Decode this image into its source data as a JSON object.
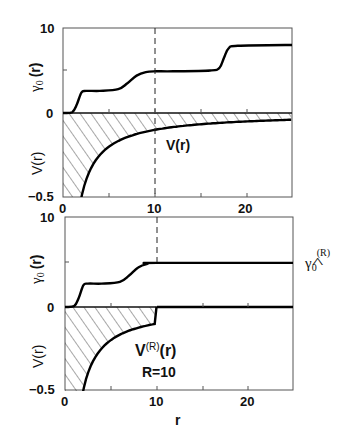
{
  "chart_data": [
    {
      "type": "line",
      "panel": "top",
      "xlabel": "r",
      "xlim": [
        0,
        25
      ],
      "x_ticks": [
        0,
        10,
        20
      ],
      "upper": {
        "ylabel": "γ0 (r)",
        "ylim": [
          0,
          10
        ],
        "y_ticks": [
          0,
          10
        ],
        "series": [
          {
            "name": "γ0(r)",
            "x": [
              0,
              1,
              1.5,
              2,
              2.5,
              4,
              6,
              7,
              8,
              9,
              10,
              12,
              16,
              17,
              17.5,
              18,
              19,
              25
            ],
            "y": [
              0,
              0.1,
              1.0,
              2.4,
              2.6,
              2.6,
              2.8,
              3.5,
              4.4,
              4.8,
              4.9,
              4.9,
              5.0,
              5.3,
              6.5,
              7.6,
              7.9,
              8.0
            ]
          }
        ]
      },
      "lower": {
        "ylabel": "V(r)",
        "ylim": [
          -0.5,
          0
        ],
        "y_ticks": [
          -0.5,
          0
        ],
        "series": [
          {
            "name": "V(r)",
            "function": "-1/r",
            "x_range": [
              2,
              25
            ]
          }
        ],
        "hatched_region": "between V(r) and 0 over full r range",
        "annotation": "V(r)"
      },
      "dashed_line_x": 10
    },
    {
      "type": "line",
      "panel": "bottom",
      "xlabel": "r",
      "xlim": [
        0,
        25
      ],
      "x_ticks": [
        0,
        10,
        20
      ],
      "upper": {
        "ylabel": "γ0 (r)",
        "ylim": [
          0,
          10
        ],
        "y_ticks": [
          0,
          10
        ],
        "series": [
          {
            "name": "γ0(r)",
            "x": [
              0,
              1,
              1.5,
              2,
              2.5,
              4,
              6,
              7,
              8,
              9,
              10,
              25
            ],
            "y": [
              0,
              0.1,
              1.0,
              2.4,
              2.6,
              2.6,
              2.8,
              3.5,
              4.4,
              4.8,
              4.9,
              4.9
            ]
          }
        ],
        "side_label": "γ̂0^(R)"
      },
      "lower": {
        "ylabel": "V(r)",
        "ylim": [
          -0.5,
          0
        ],
        "y_ticks": [
          -0.5,
          0
        ],
        "series": [
          {
            "name": "V^(R)(r)",
            "function": "-1/r for r<10, 0 for r>=10",
            "x_range": [
              2,
              25
            ]
          }
        ],
        "hatched_region": "between V(r) and 0 for r<10",
        "annotation": "V(R)(r)",
        "annotation2": "R=10"
      },
      "dashed_line_x": 10
    }
  ],
  "labels": {
    "top": {
      "y_upper_10": "10",
      "y_zero": "0",
      "y_lower_min": "−0.5",
      "gamma_label": "γ",
      "gamma_sub": "0",
      "gamma_arg": "(r)",
      "v_label": "V(r)",
      "annot": "V(r)",
      "x0": "0",
      "x10": "10",
      "x20": "20"
    },
    "bottom": {
      "y_upper_10": "10",
      "y_zero": "0",
      "y_lower_min": "−0.5",
      "gamma_label": "γ",
      "gamma_sub": "0",
      "gamma_arg": "(r)",
      "v_label": "V(r)",
      "annot_main": "V",
      "annot_sup": "(R)",
      "annot_arg": "(r)",
      "annot_r": "R=10",
      "side_gamma": "γ",
      "side_sub": "0",
      "side_sup": "(R)",
      "side_hat": "^",
      "x0": "0",
      "x10": "10",
      "x20": "20",
      "xlabel": "r"
    }
  }
}
